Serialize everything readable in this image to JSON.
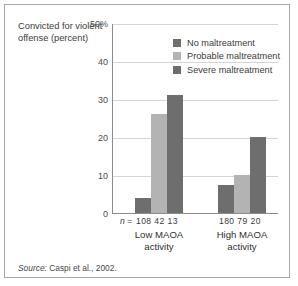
{
  "figure": {
    "axis_title": "Convicted for violent offense (percent)",
    "source_word": "Source:",
    "source_text": " Caspi et al., 2002.",
    "n_prefix_italic": "n",
    "n_prefix_rest": " ="
  },
  "colors": {
    "no_maltreatment": "#6e6e6e",
    "probable_maltreatment": "#b3b3b3",
    "severe_maltreatment": "#6e6e6e",
    "gridline": "#d4d4d4",
    "axis": "#8c8c8c",
    "frame": "#a8a8a8",
    "text": "#3b3b3b"
  },
  "chart_data": {
    "type": "bar",
    "title": "Convicted for violent offense (percent)",
    "xlabel": "",
    "ylabel": "Convicted for violent offense (percent)",
    "categories": [
      "Low MAOA activity",
      "High MAOA activity"
    ],
    "category_lines": [
      [
        "Low MAOA",
        "activity"
      ],
      [
        "High MAOA",
        "activity"
      ]
    ],
    "series": [
      {
        "name": "No maltreatment",
        "color": "#6e6e6e",
        "values": [
          4,
          7.5
        ],
        "n": [
          108,
          180
        ]
      },
      {
        "name": "Probable maltreatment",
        "color": "#b3b3b3",
        "values": [
          26,
          10
        ],
        "n": [
          42,
          79
        ]
      },
      {
        "name": "Severe maltreatment",
        "color": "#6e6e6e",
        "values": [
          31,
          20
        ],
        "n": [
          13,
          20
        ]
      }
    ],
    "ylim": [
      0,
      50
    ],
    "yticks": [
      0,
      10,
      20,
      30,
      40,
      50
    ],
    "ytick_labels": [
      "0",
      "10",
      "20",
      "30",
      "40",
      "50%"
    ],
    "grid": true,
    "legend_position": "inside-top-right",
    "n_labels": {
      "low": "108 42 13",
      "high": "180 79 20"
    },
    "annotations": [
      "Source: Caspi et al., 2002."
    ]
  }
}
